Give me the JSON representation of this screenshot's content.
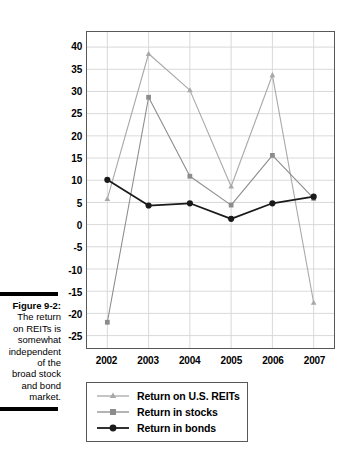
{
  "figure": {
    "caption_label": "Figure 9-2:",
    "caption_lines": [
      "The return",
      "on REITs is",
      "somewhat",
      "independent",
      "of the",
      "broad stock",
      "and bond",
      "market."
    ]
  },
  "chart_data": {
    "type": "line",
    "title": "",
    "xlabel": "",
    "ylabel": "",
    "categories": [
      "2002",
      "2003",
      "2004",
      "2005",
      "2006",
      "2007"
    ],
    "ylim": [
      -25,
      40
    ],
    "ytick_labels": [
      "40",
      "35",
      "30",
      "25",
      "20",
      "15",
      "10",
      "5",
      "0",
      "-5",
      "-10",
      "-15",
      "-20",
      "-25"
    ],
    "ytick_values": [
      40,
      35,
      30,
      25,
      20,
      15,
      10,
      5,
      0,
      -5,
      -10,
      -15,
      -20,
      -25
    ],
    "grid": true,
    "legend_position": "below-left",
    "series": [
      {
        "name": "Return on U.S. REITs",
        "marker": "triangle",
        "color": "#a8a8a8",
        "values": [
          5.8,
          38.5,
          30.3,
          8.6,
          33.7,
          -17.6
        ]
      },
      {
        "name": "Return in stocks",
        "marker": "square",
        "color": "#8c8c8c",
        "values": [
          -22.0,
          28.7,
          10.9,
          4.4,
          15.6,
          5.9
        ]
      },
      {
        "name": "Return in bonds",
        "marker": "circle",
        "color": "#1a1a1a",
        "values": [
          10.1,
          4.3,
          4.8,
          1.3,
          4.8,
          6.3
        ]
      }
    ]
  },
  "colors": {
    "axis": "#58585a",
    "grid": "#d4d4d4",
    "text": "#000000",
    "background": "#ffffff"
  }
}
